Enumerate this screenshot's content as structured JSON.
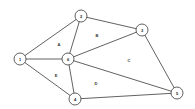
{
  "diagram": {
    "type": "planar-graph",
    "nodes": [
      {
        "id": "1",
        "label": "1",
        "x": 20,
        "y": 59
      },
      {
        "id": "2",
        "label": "2",
        "x": 81,
        "y": 16
      },
      {
        "id": "3",
        "label": "3",
        "x": 142,
        "y": 30
      },
      {
        "id": "6",
        "label": "6",
        "x": 68,
        "y": 59
      },
      {
        "id": "4",
        "label": "4",
        "x": 75,
        "y": 99
      },
      {
        "id": "5",
        "label": "5",
        "x": 177,
        "y": 93
      }
    ],
    "edges": [
      [
        "1",
        "2"
      ],
      [
        "1",
        "6"
      ],
      [
        "1",
        "4"
      ],
      [
        "2",
        "6"
      ],
      [
        "2",
        "3"
      ],
      [
        "3",
        "6"
      ],
      [
        "3",
        "5"
      ],
      [
        "6",
        "5"
      ],
      [
        "6",
        "4"
      ],
      [
        "4",
        "5"
      ]
    ],
    "regions": [
      {
        "label": "A",
        "x": 59,
        "y": 44
      },
      {
        "label": "B",
        "x": 97,
        "y": 35
      },
      {
        "label": "C",
        "x": 129,
        "y": 60
      },
      {
        "label": "D",
        "x": 96,
        "y": 83
      },
      {
        "label": "E",
        "x": 56,
        "y": 75
      }
    ],
    "colors": {
      "stroke": "#3a3a3a",
      "fill": "#ffffff"
    }
  }
}
